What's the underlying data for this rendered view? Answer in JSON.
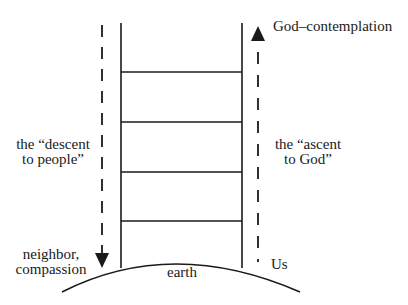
{
  "diagram": {
    "type": "ladder-diagram",
    "labels": {
      "top_right": "God–contemplation",
      "left_middle_line1": "the “descent",
      "left_middle_line2": "to people”",
      "right_middle_line1": "the “ascent",
      "right_middle_line2": "to God”",
      "bottom_left_line1": "neighbor,",
      "bottom_left_line2": "compassion",
      "bottom_center": "earth",
      "bottom_right": "Us"
    },
    "ladder": {
      "rungs": 4
    },
    "arrows": [
      {
        "name": "descent",
        "direction": "down",
        "style": "dashed"
      },
      {
        "name": "ascent",
        "direction": "up",
        "style": "dashed"
      }
    ],
    "colors": {
      "ink": "#1a1a1a",
      "background": "#ffffff"
    }
  }
}
